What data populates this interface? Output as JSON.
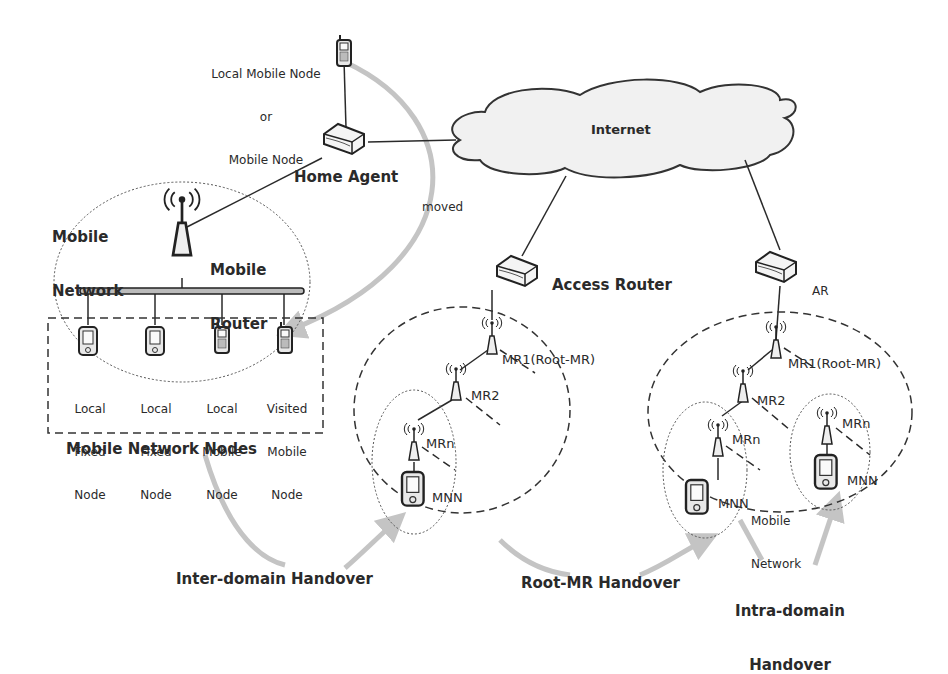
{
  "diagram": {
    "type": "network-architecture",
    "topic": "Network mobility (NEMO) handover types"
  },
  "top_node": {
    "label_line1": "Local Mobile Node",
    "label_line2": "or",
    "label_line3": "Mobile Node"
  },
  "home_agent": {
    "label": "Home Agent"
  },
  "internet": {
    "label": "Internet"
  },
  "moved_label": "moved",
  "mobile_network": {
    "label_line1": "Mobile",
    "label_line2": "Network",
    "router_label_line1": "Mobile",
    "router_label_line2": "Router",
    "group_label": "Mobile Network Nodes",
    "nodes": [
      {
        "line1": "Local",
        "line2": "Fixed",
        "line3": "Node",
        "icon": "pda-icon"
      },
      {
        "line1": "Local",
        "line2": "Fixed",
        "line3": "Node",
        "icon": "pda-icon"
      },
      {
        "line1": "Local",
        "line2": "Mobile",
        "line3": "Node",
        "icon": "cellphone-icon"
      },
      {
        "line1": "Visited",
        "line2": "Mobile",
        "line3": "Node",
        "icon": "cellphone-icon"
      }
    ]
  },
  "domain1": {
    "router_label": "Access Router",
    "mr1": "MR1(Root-MR)",
    "mr2": "MR2",
    "mrn": "MRn",
    "mnn": "MNN"
  },
  "domain2": {
    "router_label": "AR",
    "mr1": "MR1(Root-MR)",
    "mr2": "MR2",
    "mrn_left": "MRn",
    "mnn_left": "MNN",
    "mrn_right": "MRn",
    "mnn_right": "MNN",
    "subnet_label_line1": "Mobile",
    "subnet_label_line2": "Network"
  },
  "handovers": {
    "inter_domain": "Inter-domain Handover",
    "root_mr": "Root-MR Handover",
    "intra_domain_line1": "Intra-domain",
    "intra_domain_line2": "Handover"
  },
  "colors": {
    "line": "#2a2a2a",
    "arrow": "#c4c4c4",
    "cloud_fill": "#f1f1f1",
    "device_fill": "#e8e8e8"
  }
}
